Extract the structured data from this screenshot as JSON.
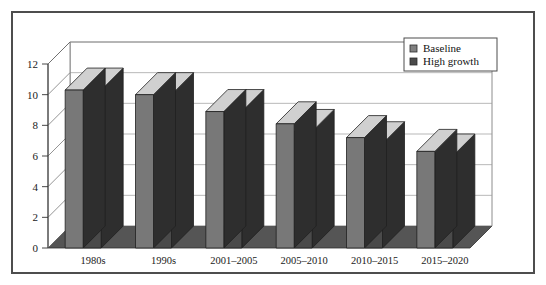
{
  "chart_data": {
    "type": "bar",
    "title": "",
    "subtitle": "",
    "xlabel": "",
    "ylabel": "",
    "categories": [
      "1980s",
      "1990s",
      "2001–2005",
      "2005–2010",
      "2010–2015",
      "2015–2020"
    ],
    "series": [
      {
        "name": "Baseline",
        "color": "#787878",
        "values": [
          10.3,
          10.0,
          8.9,
          8.1,
          7.2,
          6.3
        ]
      },
      {
        "name": "High growth",
        "color": "#4a4a4a",
        "values": [
          10.3,
          10.0,
          8.9,
          7.6,
          6.8,
          6.0
        ]
      }
    ],
    "ylim": [
      0,
      12
    ],
    "yticks": [
      0,
      2,
      4,
      6,
      8,
      10,
      12
    ],
    "ytick_labels": [
      "0",
      "2",
      "4",
      "6",
      "8",
      "10",
      "12"
    ],
    "grid": true,
    "grid_axis": "y",
    "legend_position": "top-right",
    "style": "3d-column",
    "colors": {
      "bar_top": "#d0d0d0",
      "bar_side": "#2e2e2e",
      "floor": "#555555",
      "wall": "#ffffff",
      "grid_line": "#9a9a9a",
      "axis_line": "#333333",
      "frame_border": "#4d4d4d",
      "background": "#ffffff"
    }
  },
  "legend": {
    "items": [
      {
        "label": "Baseline",
        "swatch": "#808080"
      },
      {
        "label": "High growth",
        "swatch": "#4a4a4a"
      }
    ]
  }
}
